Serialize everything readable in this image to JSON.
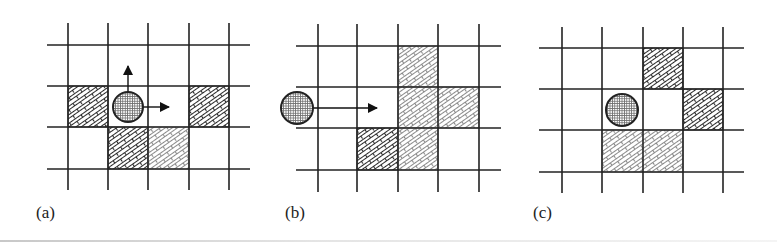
{
  "figure": {
    "colors": {
      "grid_line": "#222222",
      "dark_hatch": "#2a2a2a",
      "light_hatch": "#8a8a8a",
      "ball_outline": "#222222",
      "ball_fill_grid": "#777777",
      "background": "#ffffff"
    },
    "panels": [
      {
        "id": "a",
        "label": "(a)",
        "label_pos": [
          36,
          204
        ],
        "grid": {
          "vlines": [
            68,
            108,
            148,
            189,
            229
          ],
          "v_span": [
            23,
            190
          ],
          "hlines": [
            45,
            86,
            127,
            169
          ],
          "h_span": [
            47,
            250
          ]
        },
        "cells": [
          {
            "x": 68,
            "y": 86,
            "w": 40,
            "h": 41,
            "tone": "dark"
          },
          {
            "x": 189,
            "y": 86,
            "w": 40,
            "h": 41,
            "tone": "dark"
          },
          {
            "x": 108,
            "y": 127,
            "w": 40,
            "h": 42,
            "tone": "dark"
          },
          {
            "x": 148,
            "y": 127,
            "w": 41,
            "h": 42,
            "tone": "light"
          }
        ],
        "ball": {
          "cx": 128,
          "cy": 107,
          "r": 15
        },
        "arrows": [
          {
            "direction": "up",
            "x1": 128,
            "y1": 92,
            "x2": 128,
            "y2": 66
          },
          {
            "direction": "right",
            "x1": 143,
            "y1": 107,
            "x2": 169,
            "y2": 107
          }
        ]
      },
      {
        "id": "b",
        "label": "(b)",
        "label_pos": [
          285,
          204
        ],
        "grid": {
          "vlines": [
            318,
            357,
            398,
            438,
            479
          ],
          "v_span": [
            24,
            192
          ],
          "hlines": [
            46,
            87,
            128,
            170
          ],
          "h_span": [
            296,
            501
          ]
        },
        "cells": [
          {
            "x": 398,
            "y": 46,
            "w": 40,
            "h": 41,
            "tone": "light"
          },
          {
            "x": 398,
            "y": 87,
            "w": 81,
            "h": 41,
            "tone": "light"
          },
          {
            "x": 357,
            "y": 128,
            "w": 41,
            "h": 42,
            "tone": "dark"
          },
          {
            "x": 398,
            "y": 128,
            "w": 40,
            "h": 42,
            "tone": "light"
          }
        ],
        "ball": {
          "cx": 297,
          "cy": 108,
          "r": 16
        },
        "arrows": [
          {
            "direction": "right",
            "x1": 313,
            "y1": 108,
            "x2": 377,
            "y2": 108
          }
        ]
      },
      {
        "id": "c",
        "label": "(c)",
        "label_pos": [
          533,
          204
        ],
        "grid": {
          "vlines": [
            562,
            602,
            643,
            683,
            723
          ],
          "v_span": [
            27,
            193
          ],
          "hlines": [
            48,
            89,
            130,
            172
          ],
          "h_span": [
            539,
            744
          ]
        },
        "cells": [
          {
            "x": 643,
            "y": 48,
            "w": 40,
            "h": 41,
            "tone": "dark"
          },
          {
            "x": 683,
            "y": 89,
            "w": 40,
            "h": 41,
            "tone": "dark"
          },
          {
            "x": 602,
            "y": 130,
            "w": 81,
            "h": 42,
            "tone": "light"
          }
        ],
        "ball": {
          "cx": 622,
          "cy": 110,
          "r": 16
        },
        "arrows": []
      }
    ]
  }
}
